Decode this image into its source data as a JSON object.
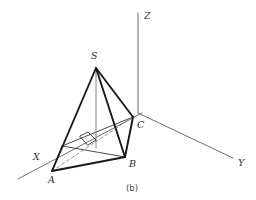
{
  "figure": {
    "caption": "(b)",
    "axes": [
      {
        "name": "X",
        "label": "X",
        "from": [
          142,
          113
        ],
        "to": [
          18,
          179
        ],
        "label_pos": [
          33,
          160
        ]
      },
      {
        "name": "Y",
        "label": "Y",
        "from": [
          138,
          113
        ],
        "to": [
          233,
          158
        ],
        "label_pos": [
          238,
          166
        ]
      },
      {
        "name": "Z",
        "label": "Z",
        "from": [
          138,
          113
        ],
        "to": [
          138,
          13
        ],
        "label_pos": [
          144,
          19
        ]
      }
    ],
    "vertices": [
      {
        "name": "S",
        "label": "S",
        "pos": [
          96,
          68
        ],
        "label_pos": [
          91,
          59
        ]
      },
      {
        "name": "A",
        "label": "A",
        "pos": [
          52,
          171
        ],
        "label_pos": [
          48,
          183
        ]
      },
      {
        "name": "B",
        "label": "B",
        "pos": [
          125,
          157
        ],
        "label_pos": [
          129,
          167
        ]
      },
      {
        "name": "C",
        "label": "C",
        "pos": [
          133,
          117
        ],
        "label_pos": [
          137,
          128
        ]
      }
    ],
    "solid_edges": [
      {
        "name": "edge-S-A",
        "from": [
          96,
          68
        ],
        "to": [
          52,
          171
        ]
      },
      {
        "name": "edge-S-B",
        "from": [
          96,
          68
        ],
        "to": [
          125,
          157
        ]
      },
      {
        "name": "edge-S-C",
        "from": [
          96,
          68
        ],
        "to": [
          133,
          117
        ]
      },
      {
        "name": "edge-A-B",
        "from": [
          52,
          171
        ],
        "to": [
          125,
          157
        ]
      },
      {
        "name": "edge-B-C",
        "from": [
          125,
          157
        ],
        "to": [
          133,
          117
        ]
      }
    ],
    "thin_edges": [
      {
        "name": "edge-A-Cplane",
        "from": [
          52,
          171
        ],
        "to": [
          133,
          117
        ]
      },
      {
        "name": "edge-A-base-far",
        "from": [
          52,
          171
        ],
        "to": [
          62,
          146
        ]
      },
      {
        "name": "edge-base-far-C",
        "from": [
          62,
          146
        ],
        "to": [
          133,
          117
        ]
      },
      {
        "name": "edge-base-far-B",
        "from": [
          62,
          146
        ],
        "to": [
          125,
          157
        ]
      }
    ],
    "dashed_edges": [
      {
        "name": "edge-A-C-hidden",
        "from": [
          52,
          171
        ],
        "to": [
          133,
          117
        ]
      }
    ],
    "altitude": {
      "name": "altitude-S-to-base",
      "from": [
        96,
        68
      ],
      "to": [
        96,
        148
      ]
    },
    "right_angle_marker": {
      "name": "right-angle-marker",
      "points": "80,136 88,132 96,140 88,145"
    },
    "caption_pos": [
      126,
      191
    ]
  },
  "colors": {
    "background": "#ffffff",
    "solid_edge": "#1a1a1a",
    "thin_edge": "#2b2b2b",
    "axis": "#6e6e6e",
    "dashed": "#8a8a8a",
    "label_text": "#262626"
  }
}
